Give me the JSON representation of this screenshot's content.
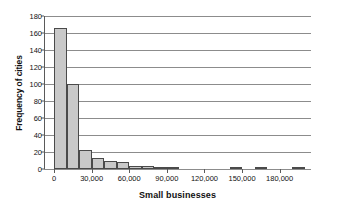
{
  "chart_data": {
    "type": "bar",
    "title": "",
    "xlabel": "Small businesses",
    "ylabel": "Frequency of cities",
    "grid": "horizontal",
    "legend": "none",
    "xlim": [
      -8000,
      205000
    ],
    "ylim": [
      0,
      180
    ],
    "bin_width": 10000,
    "ytick_labels": [
      "180",
      "160",
      "140",
      "120",
      "100",
      "80",
      "60",
      "40",
      "20",
      "0"
    ],
    "ytick_values": [
      180,
      160,
      140,
      120,
      100,
      80,
      60,
      40,
      20,
      0
    ],
    "xtick_labels": [
      "0",
      "30,000",
      "60,000",
      "90,000",
      "120,000",
      "150,000",
      "180,000"
    ],
    "xtick_values": [
      0,
      30000,
      60000,
      90000,
      120000,
      150000,
      180000
    ],
    "bin_starts": [
      0,
      10000,
      20000,
      30000,
      40000,
      50000,
      60000,
      70000,
      80000,
      90000,
      100000,
      110000,
      120000,
      130000,
      140000,
      150000,
      160000,
      170000,
      180000,
      190000
    ],
    "values": [
      166,
      100,
      22,
      13,
      10,
      8,
      4,
      3,
      2,
      2,
      0,
      0,
      0,
      0,
      2,
      0,
      2,
      0,
      0,
      2
    ],
    "bar_color": "#c9c9c9",
    "bar_edge_color": "#4a4a4a",
    "grid_color": "#8c8c8c",
    "axis_color": "#5a5a5a",
    "text_color": "#111111",
    "background": "#ffffff"
  }
}
